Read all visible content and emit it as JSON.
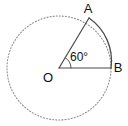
{
  "figure": {
    "background_color": "#ffffff",
    "stroke_color": "#3a3a3a",
    "dotted_stroke_color": "#8a8a8a",
    "text_color": "#111111",
    "labels": {
      "center": "O",
      "point_a": "A",
      "point_b": "B",
      "angle": "60°"
    },
    "geometry": {
      "center_x": 59,
      "center_y": 68,
      "radius": 52,
      "angle_degrees": 60,
      "point_a_x": 89,
      "point_a_y": 18,
      "point_b_x": 111,
      "point_b_y": 68,
      "angle_marker_radius": 12
    }
  }
}
